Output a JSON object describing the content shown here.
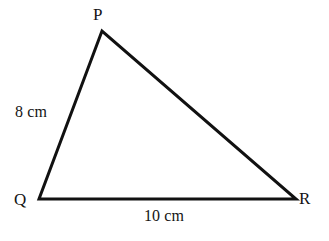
{
  "figure": {
    "type": "geometry-diagram",
    "shape": "triangle",
    "background_color": "#ffffff",
    "stroke_color": "#111111",
    "text_color": "#141414",
    "stroke_width": 3,
    "vertices": [
      {
        "name": "P",
        "label": "P",
        "x": 102,
        "y": 31,
        "label_x": 93,
        "label_y": 6
      },
      {
        "name": "Q",
        "label": "Q",
        "x": 39,
        "y": 199,
        "label_x": 14,
        "label_y": 191
      },
      {
        "name": "R",
        "label": "R",
        "x": 296,
        "y": 199,
        "label_x": 299,
        "label_y": 190
      }
    ],
    "sides": [
      {
        "name": "PQ",
        "from": "P",
        "to": "Q",
        "label": "8 cm",
        "label_x": 15,
        "label_y": 104
      },
      {
        "name": "QR",
        "from": "Q",
        "to": "R",
        "label": "10 cm",
        "label_x": 144,
        "label_y": 208
      },
      {
        "name": "PR",
        "from": "P",
        "to": "R",
        "label": ""
      }
    ],
    "path": "M 102 31 L 39 199 L 296 199 Z"
  }
}
